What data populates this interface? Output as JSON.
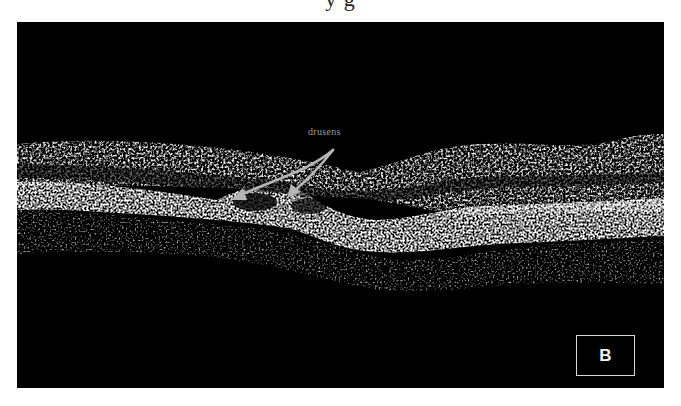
{
  "figure": {
    "caption_fragment": "y g",
    "panel_label": "B",
    "annotation": {
      "label": "drusens",
      "arrow_color": "#b5b5b5",
      "arrows": [
        {
          "from": [
            316,
            128
          ],
          "to": [
            218,
            176
          ]
        },
        {
          "from": [
            316,
            128
          ],
          "to": [
            273,
            173
          ]
        }
      ]
    },
    "colors": {
      "background": "#ffffff",
      "scan_background": "#000000",
      "tissue": "#d0d0d0",
      "label_border": "#d8d8d8"
    }
  }
}
